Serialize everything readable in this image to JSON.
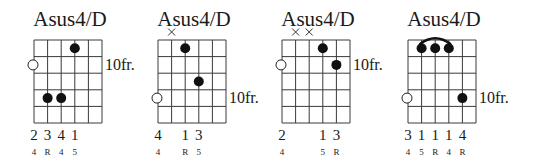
{
  "colors": {
    "ink": "#111111",
    "background": "#ffffff"
  },
  "diagrams": [
    {
      "title": "Asus4/D",
      "fret_label": "10fr.",
      "fret_label_row": 2,
      "strings": 6,
      "frets": 5,
      "dots": [
        {
          "string_col": 3,
          "fret": 1
        },
        {
          "string_col": 1,
          "fret": 4
        },
        {
          "string_col": 2,
          "fret": 4
        }
      ],
      "open_marker": {
        "fret": 2
      },
      "muted_cols": [],
      "barre": null,
      "fingers": [
        {
          "col": 0,
          "text": "2"
        },
        {
          "col": 1,
          "text": "3"
        },
        {
          "col": 2,
          "text": "4"
        },
        {
          "col": 3,
          "text": "1"
        }
      ],
      "intervals": [
        {
          "col": 0,
          "text": "4"
        },
        {
          "col": 1,
          "text": "R"
        },
        {
          "col": 2,
          "text": "4"
        },
        {
          "col": 3,
          "text": "5"
        }
      ]
    },
    {
      "title": "Asus4/D",
      "fret_label": "10fr.",
      "fret_label_row": 4,
      "strings": 6,
      "frets": 5,
      "dots": [
        {
          "string_col": 2,
          "fret": 1
        },
        {
          "string_col": 3,
          "fret": 3
        }
      ],
      "open_marker": {
        "fret": 4
      },
      "muted_cols": [
        1
      ],
      "barre": null,
      "fingers": [
        {
          "col": 0,
          "text": "4"
        },
        {
          "col": 2,
          "text": "1"
        },
        {
          "col": 3,
          "text": "3"
        }
      ],
      "intervals": [
        {
          "col": 0,
          "text": "4"
        },
        {
          "col": 2,
          "text": "R"
        },
        {
          "col": 3,
          "text": "5"
        }
      ]
    },
    {
      "title": "Asus4/D",
      "fret_label": "10fr.",
      "fret_label_row": 2,
      "strings": 6,
      "frets": 5,
      "dots": [
        {
          "string_col": 3,
          "fret": 1
        },
        {
          "string_col": 4,
          "fret": 2
        }
      ],
      "open_marker": {
        "fret": 2
      },
      "muted_cols": [
        1,
        2
      ],
      "barre": null,
      "fingers": [
        {
          "col": 0,
          "text": "2"
        },
        {
          "col": 3,
          "text": "1"
        },
        {
          "col": 4,
          "text": "3"
        }
      ],
      "intervals": [
        {
          "col": 0,
          "text": "4"
        },
        {
          "col": 3,
          "text": "5"
        },
        {
          "col": 4,
          "text": "R"
        }
      ]
    },
    {
      "title": "Asus4/D",
      "fret_label": "10fr.",
      "fret_label_row": 4,
      "strings": 6,
      "frets": 5,
      "dots": [
        {
          "string_col": 1,
          "fret": 1
        },
        {
          "string_col": 2,
          "fret": 1
        },
        {
          "string_col": 3,
          "fret": 1
        },
        {
          "string_col": 4,
          "fret": 4
        }
      ],
      "open_marker": {
        "fret": 4
      },
      "muted_cols": [],
      "barre": {
        "from_col": 1,
        "to_col": 3,
        "fret": 1
      },
      "fingers": [
        {
          "col": 0,
          "text": "3"
        },
        {
          "col": 1,
          "text": "1"
        },
        {
          "col": 2,
          "text": "1"
        },
        {
          "col": 3,
          "text": "1"
        },
        {
          "col": 4,
          "text": "4"
        }
      ],
      "intervals": [
        {
          "col": 0,
          "text": "4"
        },
        {
          "col": 1,
          "text": "5"
        },
        {
          "col": 2,
          "text": "R"
        },
        {
          "col": 3,
          "text": "4"
        },
        {
          "col": 4,
          "text": "R"
        }
      ]
    }
  ]
}
